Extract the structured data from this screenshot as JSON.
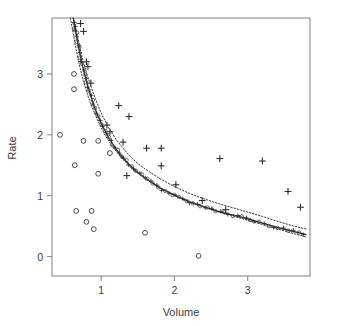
{
  "chart_data": {
    "type": "scatter",
    "title": "",
    "xlabel": "Volume",
    "ylabel": "Rate",
    "xlim": [
      0.33,
      3.85
    ],
    "ylim": [
      -0.32,
      3.92
    ],
    "xticks": [
      1,
      2,
      3
    ],
    "xtick_labels": [
      "1",
      "2",
      "3"
    ],
    "yticks": [
      0,
      1,
      2,
      3
    ],
    "ytick_labels": [
      "0",
      "1",
      "2",
      "3"
    ],
    "grid": false,
    "legend": "none",
    "frame": "box",
    "series": [
      {
        "name": "circles",
        "marker": "circle",
        "color": "#4a4a4a",
        "points": [
          [
            0.44,
            2.0
          ],
          [
            0.63,
            3.0
          ],
          [
            0.63,
            2.75
          ],
          [
            0.64,
            1.5
          ],
          [
            0.66,
            0.75
          ],
          [
            0.76,
            1.9
          ],
          [
            0.8,
            0.57
          ],
          [
            0.87,
            0.75
          ],
          [
            0.9,
            0.45
          ],
          [
            0.96,
            1.9
          ],
          [
            0.96,
            1.36
          ],
          [
            1.12,
            1.7
          ],
          [
            1.6,
            0.39
          ],
          [
            2.33,
            0.01
          ]
        ]
      },
      {
        "name": "plus-markers",
        "marker": "plus",
        "color": "#2e2e2e",
        "points": [
          [
            0.72,
            3.83
          ],
          [
            0.76,
            3.7
          ],
          [
            0.8,
            3.2
          ],
          [
            0.82,
            3.12
          ],
          [
            0.86,
            2.85
          ],
          [
            1.08,
            2.16
          ],
          [
            1.12,
            2.05
          ],
          [
            1.24,
            2.48
          ],
          [
            1.38,
            2.3
          ],
          [
            1.3,
            1.88
          ],
          [
            1.35,
            1.33
          ],
          [
            1.62,
            1.78
          ],
          [
            1.82,
            1.78
          ],
          [
            1.82,
            1.49
          ],
          [
            2.02,
            1.18
          ],
          [
            2.38,
            0.92
          ],
          [
            2.62,
            1.61
          ],
          [
            2.7,
            0.77
          ],
          [
            3.2,
            1.57
          ],
          [
            3.55,
            1.07
          ],
          [
            3.72,
            0.81
          ]
        ]
      }
    ],
    "fitted_curve": {
      "name": "fitted-curve",
      "style": "solid",
      "color": "#2b2b2b",
      "description": "monotone decreasing hyperbolic fit",
      "points": [
        [
          0.62,
          3.92
        ],
        [
          0.65,
          3.72
        ],
        [
          0.68,
          3.52
        ],
        [
          0.71,
          3.34
        ],
        [
          0.75,
          3.12
        ],
        [
          0.8,
          2.88
        ],
        [
          0.85,
          2.67
        ],
        [
          0.9,
          2.49
        ],
        [
          0.95,
          2.33
        ],
        [
          1.0,
          2.19
        ],
        [
          1.1,
          1.96
        ],
        [
          1.2,
          1.77
        ],
        [
          1.3,
          1.62
        ],
        [
          1.4,
          1.49
        ],
        [
          1.5,
          1.38
        ],
        [
          1.6,
          1.29
        ],
        [
          1.8,
          1.13
        ],
        [
          2.0,
          1.01
        ],
        [
          2.2,
          0.9
        ],
        [
          2.4,
          0.82
        ],
        [
          2.6,
          0.74
        ],
        [
          2.8,
          0.68
        ],
        [
          3.0,
          0.62
        ],
        [
          3.2,
          0.55
        ],
        [
          3.4,
          0.48
        ],
        [
          3.6,
          0.42
        ],
        [
          3.8,
          0.36
        ]
      ]
    },
    "confidence_bands": {
      "name": "confidence-bands",
      "style": "dotted",
      "color": "#3a3a3a",
      "upper": [
        [
          0.62,
          3.92
        ],
        [
          0.66,
          3.72
        ],
        [
          0.7,
          3.5
        ],
        [
          0.74,
          3.28
        ],
        [
          0.8,
          3.02
        ],
        [
          0.86,
          2.8
        ],
        [
          0.92,
          2.6
        ],
        [
          1.0,
          2.36
        ],
        [
          1.1,
          2.12
        ],
        [
          1.2,
          1.93
        ],
        [
          1.3,
          1.78
        ],
        [
          1.4,
          1.64
        ],
        [
          1.5,
          1.53
        ],
        [
          1.6,
          1.44
        ],
        [
          1.8,
          1.28
        ],
        [
          2.0,
          1.15
        ],
        [
          2.2,
          1.04
        ],
        [
          2.4,
          0.95
        ],
        [
          2.6,
          0.87
        ],
        [
          2.8,
          0.8
        ],
        [
          3.0,
          0.73
        ],
        [
          3.2,
          0.66
        ],
        [
          3.4,
          0.58
        ],
        [
          3.6,
          0.51
        ],
        [
          3.8,
          0.45
        ]
      ],
      "lower": [
        [
          0.58,
          3.92
        ],
        [
          0.62,
          3.66
        ],
        [
          0.66,
          3.4
        ],
        [
          0.7,
          3.16
        ],
        [
          0.76,
          2.88
        ],
        [
          0.82,
          2.64
        ],
        [
          0.88,
          2.44
        ],
        [
          0.96,
          2.22
        ],
        [
          1.06,
          1.98
        ],
        [
          1.16,
          1.8
        ],
        [
          1.26,
          1.65
        ],
        [
          1.36,
          1.52
        ],
        [
          1.46,
          1.41
        ],
        [
          1.56,
          1.32
        ],
        [
          1.76,
          1.16
        ],
        [
          1.96,
          1.03
        ],
        [
          2.16,
          0.92
        ],
        [
          2.36,
          0.83
        ],
        [
          2.56,
          0.75
        ],
        [
          2.76,
          0.68
        ],
        [
          2.96,
          0.61
        ],
        [
          3.16,
          0.54
        ],
        [
          3.36,
          0.47
        ],
        [
          3.56,
          0.4
        ],
        [
          3.8,
          0.32
        ]
      ]
    }
  },
  "axes": {
    "x_title": "Volume",
    "y_title": "Rate",
    "x_tick_labels": [
      "1",
      "2",
      "3"
    ],
    "y_tick_labels": [
      "0",
      "1",
      "2",
      "3"
    ]
  },
  "colors": {
    "frame": "#8c8c8c",
    "text": "#3c3c3c",
    "marker_circle": "#4a4a4a",
    "marker_plus": "#2e2e2e",
    "curve": "#2b2b2b",
    "band": "#3a3a3a",
    "background": "#ffffff"
  }
}
